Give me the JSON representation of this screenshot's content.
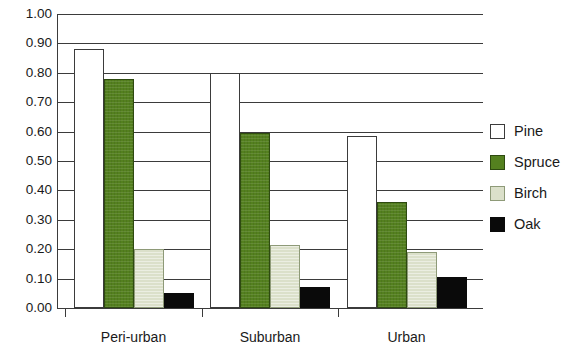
{
  "chart_data": {
    "type": "bar",
    "title": "",
    "subtitle": "",
    "xlabel": "",
    "ylabel": "",
    "ylim": [
      0.0,
      1.0
    ],
    "ytick_step": 0.1,
    "grid": "horizontal",
    "legend_position": "right",
    "categories": [
      "Peri-urban",
      "Suburban",
      "Urban"
    ],
    "ytick_labels": [
      "1.00",
      "0.90",
      "0.80",
      "0.70",
      "0.60",
      "0.50",
      "0.40",
      "0.30",
      "0.20",
      "0.10",
      "0.00"
    ],
    "ytick_values": [
      1.0,
      0.9,
      0.8,
      0.7,
      0.6,
      0.5,
      0.4,
      0.3,
      0.2,
      0.1,
      0.0
    ],
    "series": [
      {
        "name": "Pine",
        "color": "#ffffff",
        "values": [
          0.88,
          0.8,
          0.585
        ]
      },
      {
        "name": "Spruce",
        "color": "#54801f",
        "values": [
          0.78,
          0.595,
          0.36
        ]
      },
      {
        "name": "Birch",
        "color": "#dbe0ca",
        "values": [
          0.2,
          0.215,
          0.19
        ]
      },
      {
        "name": "Oak",
        "color": "#0a0a0a",
        "values": [
          0.05,
          0.07,
          0.105
        ]
      }
    ]
  },
  "legend": {
    "items": [
      {
        "label": "Pine",
        "swatch": "pine"
      },
      {
        "label": "Spruce",
        "swatch": "spruce"
      },
      {
        "label": "Birch",
        "swatch": "birch"
      },
      {
        "label": "Oak",
        "swatch": "oak"
      }
    ]
  },
  "axes": {
    "x_categories": [
      "Peri-urban",
      "Suburban",
      "Urban"
    ],
    "y_labels": [
      "1.00",
      "0.90",
      "0.80",
      "0.70",
      "0.60",
      "0.50",
      "0.40",
      "0.30",
      "0.20",
      "0.10",
      "0.00"
    ]
  }
}
